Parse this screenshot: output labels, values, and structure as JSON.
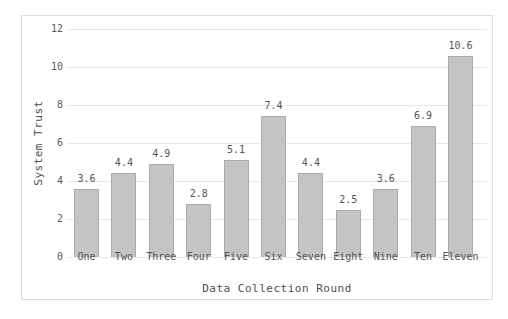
{
  "figure": {
    "background": "#ffffff",
    "frame_border_color": "#dcdcdc"
  },
  "chart_data": {
    "type": "bar",
    "title": "",
    "xlabel": "Data Collection Round",
    "ylabel": "System Trust",
    "categories": [
      "One",
      "Two",
      "Three",
      "Four",
      "Five",
      "Six",
      "Seven",
      "Eight",
      "Nine",
      "Ten",
      "Eleven"
    ],
    "values": [
      3.6,
      4.4,
      4.9,
      2.8,
      5.1,
      7.4,
      4.4,
      2.5,
      3.6,
      6.9,
      10.6
    ],
    "value_labels": [
      "3.6",
      "4.4",
      "4.9",
      "2.8",
      "5.1",
      "7.4",
      "4.4",
      "2.5",
      "3.6",
      "6.9",
      "10.6"
    ],
    "ylim": [
      0,
      12
    ],
    "yticks": [
      0,
      2,
      4,
      6,
      8,
      10,
      12
    ],
    "grid": "horizontal",
    "legend": "none",
    "bar_fill": "#c4c4c4",
    "bar_edge": "#ababab",
    "gridline_color": "#e8e8e8",
    "tick_text_color": "#5a5a5a",
    "axis_title_color": "#4d4d4d"
  }
}
